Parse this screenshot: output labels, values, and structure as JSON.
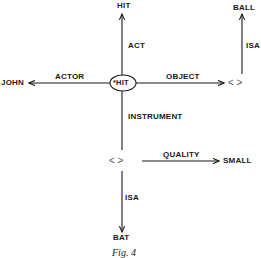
{
  "figure": {
    "caption": "Fig. 4"
  },
  "nodes": {
    "center": "*HIT",
    "act_target": "HIT",
    "actor_target": "JOHN",
    "object_placeholder": "<  >",
    "ball": "BALL",
    "instrument_placeholder": "<  >",
    "small": "SMALL",
    "bat": "BAT"
  },
  "edges": {
    "act": "ACT",
    "actor": "ACTOR",
    "object": "OBJECT",
    "object_isa": "ISA",
    "instrument": "INSTRUMENT",
    "quality": "QUALITY",
    "instrument_isa": "ISA"
  },
  "colors": {
    "ink": "#1a1a1a",
    "background": "#ffffff"
  }
}
